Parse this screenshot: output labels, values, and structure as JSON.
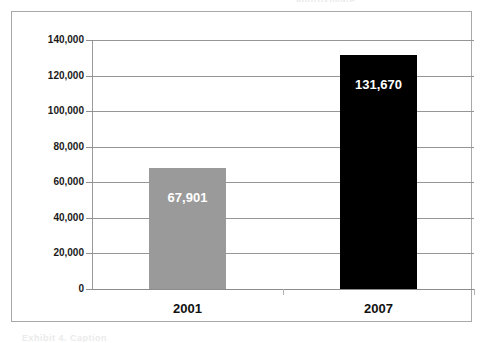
{
  "figure": {
    "background_color": "#ffffff",
    "frame_color": "#a8a8a8",
    "gridline_color": "#969696"
  },
  "scan_artifacts": {
    "top_fragment": "approximate",
    "bottom_fragment": "Exhibit 4. Caption"
  },
  "chart_data": {
    "type": "bar",
    "title": "",
    "subtitle": "",
    "xlabel": "",
    "ylabel": "",
    "categories": [
      "2001",
      "2007"
    ],
    "values": [
      67901,
      131670
    ],
    "value_labels": [
      "67,901",
      "131,670"
    ],
    "series": [
      {
        "name": "Count",
        "values": [
          67901,
          131670
        ],
        "colors": [
          "#9a9a9a",
          "#000000"
        ]
      }
    ],
    "ylim": [
      0,
      140000
    ],
    "ytick_values": [
      0,
      20000,
      40000,
      60000,
      80000,
      100000,
      120000,
      140000
    ],
    "ytick_labels": [
      "0",
      "20,000",
      "40,000",
      "60,000",
      "80,000",
      "100,000",
      "120,000",
      "140,000"
    ],
    "grid": true,
    "grid_axis": "y",
    "legend": false,
    "legend_position": "none",
    "bar_label_position": "inside-top",
    "bar_label_color": "#ffffff",
    "annotations": []
  }
}
